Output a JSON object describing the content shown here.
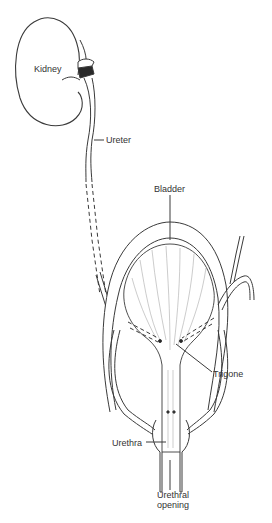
{
  "diagram": {
    "type": "anatomical-illustration",
    "labels": {
      "kidney": "Kidney",
      "ureter": "Ureter",
      "bladder": "Bladder",
      "trigone": "Trigone",
      "urethra": "Urethra",
      "urethral_opening_line1": "Urethral",
      "urethral_opening_line2": "opening"
    },
    "colors": {
      "line": "#3a3a3a",
      "fill": "#ffffff",
      "text": "#333333"
    }
  }
}
